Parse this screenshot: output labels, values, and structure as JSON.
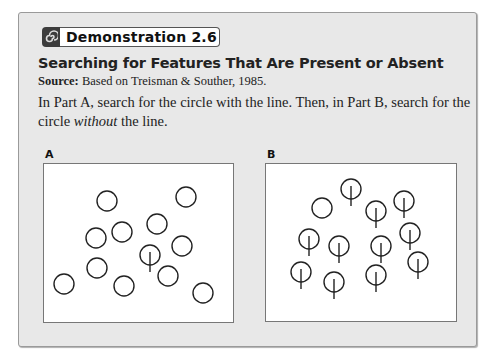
{
  "header": {
    "badge_icon": "spiral-icon",
    "badge_label": "Demonstration 2.6"
  },
  "title": "Searching for Features That Are Present or Absent",
  "source": {
    "label": "Source:",
    "text": " Based on Treisman & Souther, 1985."
  },
  "instructions": {
    "part1": "In Part A, search for the circle with the line. Then, in Part B, search for the circle ",
    "emphasis": "without",
    "part2": " the line."
  },
  "panels": [
    {
      "label": "A",
      "circles": [
        {
          "x": 107,
          "y": 201,
          "line": false
        },
        {
          "x": 186,
          "y": 197,
          "line": false
        },
        {
          "x": 96,
          "y": 238,
          "line": false
        },
        {
          "x": 122,
          "y": 232,
          "line": false
        },
        {
          "x": 157,
          "y": 224,
          "line": false
        },
        {
          "x": 182,
          "y": 246,
          "line": false
        },
        {
          "x": 150,
          "y": 255,
          "line": true
        },
        {
          "x": 97,
          "y": 268,
          "line": false
        },
        {
          "x": 64,
          "y": 284,
          "line": false
        },
        {
          "x": 124,
          "y": 286,
          "line": false
        },
        {
          "x": 168,
          "y": 276,
          "line": false
        },
        {
          "x": 203,
          "y": 293,
          "line": false
        }
      ]
    },
    {
      "label": "B",
      "circles": [
        {
          "x": 351,
          "y": 189,
          "line": true
        },
        {
          "x": 322,
          "y": 208,
          "line": false
        },
        {
          "x": 376,
          "y": 211,
          "line": true
        },
        {
          "x": 404,
          "y": 201,
          "line": true
        },
        {
          "x": 309,
          "y": 239,
          "line": true
        },
        {
          "x": 339,
          "y": 246,
          "line": true
        },
        {
          "x": 381,
          "y": 246,
          "line": true
        },
        {
          "x": 410,
          "y": 233,
          "line": true
        },
        {
          "x": 418,
          "y": 262,
          "line": true
        },
        {
          "x": 301,
          "y": 272,
          "line": true
        },
        {
          "x": 334,
          "y": 282,
          "line": true
        },
        {
          "x": 376,
          "y": 275,
          "line": true
        }
      ]
    }
  ]
}
